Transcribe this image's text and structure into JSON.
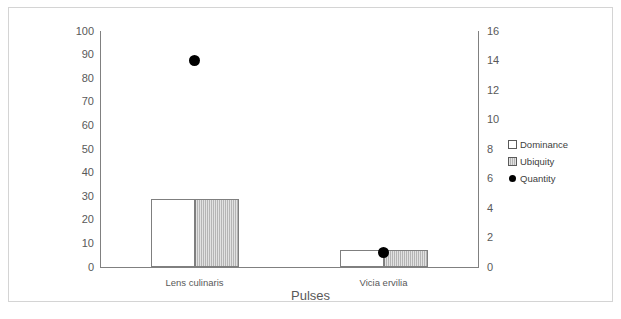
{
  "chart_data": {
    "type": "bar",
    "title": "",
    "xlabel": "Pulses",
    "ylabel": "",
    "categories": [
      "Lens culinaris",
      "Vicia ervilia"
    ],
    "series": [
      {
        "name": "Dominance",
        "axis": "left",
        "marker": "white-square",
        "values": [
          29,
          7
        ]
      },
      {
        "name": "Ubiquity",
        "axis": "left",
        "marker": "hatched-square",
        "values": [
          29,
          7
        ]
      },
      {
        "name": "Quantity",
        "axis": "right",
        "marker": "black-circle",
        "values": [
          14,
          1
        ]
      }
    ],
    "left_axis": {
      "ylim": [
        0,
        100
      ],
      "ticks": [
        0,
        10,
        20,
        30,
        40,
        50,
        60,
        70,
        80,
        90,
        100
      ],
      "tick_labels": [
        "0",
        "10",
        "20",
        "30",
        "40",
        "50",
        "60",
        "70",
        "80",
        "90",
        "100"
      ]
    },
    "right_axis": {
      "ylim": [
        0,
        16
      ],
      "ticks": [
        0,
        2,
        4,
        6,
        8,
        10,
        12,
        14,
        16
      ],
      "tick_labels": [
        "0",
        "2",
        "4",
        "6",
        "8",
        "10",
        "12",
        "14",
        "16"
      ]
    },
    "grid": false,
    "legend_position": "right",
    "colors": {
      "dominance": "#ffffff",
      "ubiquity": "#bfbfbf",
      "quantity": "#000000",
      "axis": "#808080",
      "bar_outline": "#7f7f7f",
      "text": "#595959",
      "frame": "#d4d4d4"
    }
  },
  "legend": {
    "items": [
      {
        "label": "Dominance",
        "marker": "white-square-icon"
      },
      {
        "label": "Ubiquity",
        "marker": "hatched-square-icon"
      },
      {
        "label": "Quantity",
        "marker": "black-circle-icon"
      }
    ]
  },
  "axis_title": "Pulses"
}
